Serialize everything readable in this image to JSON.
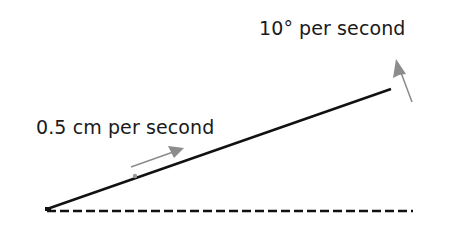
{
  "diagram": {
    "labels": {
      "rotation_rate": "10° per second",
      "linear_rate": "0.5 cm per second"
    },
    "colors": {
      "line": "#111111",
      "arrow": "#8c8c8c",
      "background": "#ffffff"
    },
    "elements": {
      "rotating_line": {
        "x1": 47,
        "y1": 209,
        "x2": 391,
        "y2": 89
      },
      "baseline_dashed": {
        "x1": 47,
        "y1": 211,
        "x2": 413,
        "y2": 211
      },
      "linear_arrow": {
        "x1": 131,
        "y1": 166,
        "x2": 184,
        "y2": 148
      },
      "rotation_arrow": {
        "x1": 412,
        "y1": 102,
        "x2": 396,
        "y2": 60
      },
      "point_marker": {
        "cx": 135,
        "cy": 175
      }
    }
  }
}
